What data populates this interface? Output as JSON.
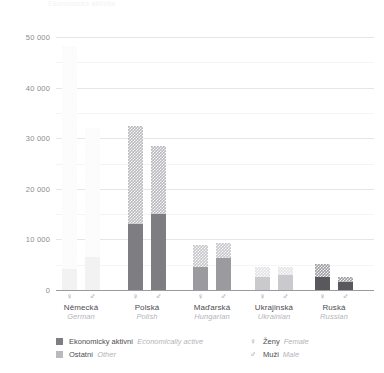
{
  "chart_data": {
    "type": "bar",
    "title": "Ekonomická aktivita",
    "subtype": "stacked-grouped-bar",
    "xlabel": "",
    "ylabel": "",
    "ylim": [
      0,
      50000
    ],
    "grid": true,
    "y_ticks": [
      {
        "value": 50000,
        "label": "50 000"
      },
      {
        "value": 45000,
        "label": "",
        "minor": true
      },
      {
        "value": 40000,
        "label": "40 000"
      },
      {
        "value": 35000,
        "label": "",
        "minor": true
      },
      {
        "value": 30000,
        "label": "30 000"
      },
      {
        "value": 25000,
        "label": "",
        "minor": true
      },
      {
        "value": 20000,
        "label": "20 000"
      },
      {
        "value": 15000,
        "label": "",
        "minor": true
      },
      {
        "value": 10000,
        "label": "10 000"
      },
      {
        "value": 5000,
        "label": "",
        "minor": true
      },
      {
        "value": 0,
        "label": "0"
      }
    ],
    "categories": [
      {
        "cs": "Německá",
        "en": "German"
      },
      {
        "cs": "Polská",
        "en": "Polish"
      },
      {
        "cs": "Maďarská",
        "en": "Hungarian"
      },
      {
        "cs": "Ukrajinská",
        "en": "Ukrainian"
      },
      {
        "cs": "Ruská",
        "en": "Russian"
      }
    ],
    "genders": [
      {
        "key": "female",
        "symbol": "♀",
        "cs": "Ženy",
        "en": "Female"
      },
      {
        "key": "male",
        "symbol": "♂",
        "cs": "Muži",
        "en": "Male"
      }
    ],
    "stack_keys": [
      {
        "key": "active",
        "cs": "Ekonomicky aktivní",
        "en": "Economically active",
        "pattern": "solid"
      },
      {
        "key": "other",
        "cs": "Ostatní",
        "en": "Other",
        "pattern": "hatched"
      }
    ],
    "series": [
      {
        "category": "Německá",
        "color_active": "#f2f2f2",
        "color_other": "#fafafa",
        "bars": [
          {
            "gender": "female",
            "active": 4200,
            "other": 44000,
            "total": 48200
          },
          {
            "gender": "male",
            "active": 6500,
            "other": 25500,
            "total": 32000
          }
        ]
      },
      {
        "category": "Polská",
        "color_active": "#7d7d82",
        "color_other": "#b9b9be",
        "bars": [
          {
            "gender": "female",
            "active": 13000,
            "other": 19400,
            "total": 32400
          },
          {
            "gender": "male",
            "active": 15000,
            "other": 13400,
            "total": 28400
          }
        ]
      },
      {
        "category": "Maďarská",
        "color_active": "#9a9a9f",
        "color_other": "#c6c6cb",
        "bars": [
          {
            "gender": "female",
            "active": 4500,
            "other": 4400,
            "total": 8900
          },
          {
            "gender": "male",
            "active": 6300,
            "other": 3000,
            "total": 9300
          }
        ]
      },
      {
        "category": "Ukrajinská",
        "color_active": "#cacace",
        "color_other": "#e2e2e6",
        "bars": [
          {
            "gender": "female",
            "active": 2600,
            "other": 1900,
            "total": 4500
          },
          {
            "gender": "male",
            "active": 3000,
            "other": 1500,
            "total": 4500
          }
        ]
      },
      {
        "category": "Ruská",
        "color_active": "#58585d",
        "color_other": "#9e9ea3",
        "bars": [
          {
            "gender": "female",
            "active": 2600,
            "other": 2500,
            "total": 5100
          },
          {
            "gender": "male",
            "active": 1600,
            "other": 1000,
            "total": 2600
          }
        ]
      }
    ],
    "legend": {
      "position": "bottom",
      "stack_entries": [
        {
          "cs": "Ekonomicky aktivní",
          "en": "Economically active",
          "swatch": "#7d7d82",
          "pattern": "solid"
        },
        {
          "cs": "Ostatní",
          "en": "Other",
          "swatch": "#b9b9be",
          "pattern": "hatched"
        }
      ],
      "gender_entries": [
        {
          "symbol": "♀",
          "cs": "Ženy",
          "en": "Female"
        },
        {
          "symbol": "♂",
          "cs": "Muži",
          "en": "Male"
        }
      ]
    }
  }
}
